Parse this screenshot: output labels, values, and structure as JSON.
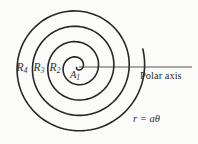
{
  "figure": {
    "radii_labels": [
      {
        "base": "R",
        "sub": "4"
      },
      {
        "base": "R",
        "sub": "3"
      },
      {
        "base": "R",
        "sub": "2"
      }
    ],
    "center_label": {
      "base": "A",
      "sub": "1"
    },
    "axis_label": "Polar axis",
    "equation": "r = aθ",
    "colors": {
      "background": "#fbfbf9",
      "stroke": "#262626",
      "text": "#2e2e2e"
    }
  }
}
